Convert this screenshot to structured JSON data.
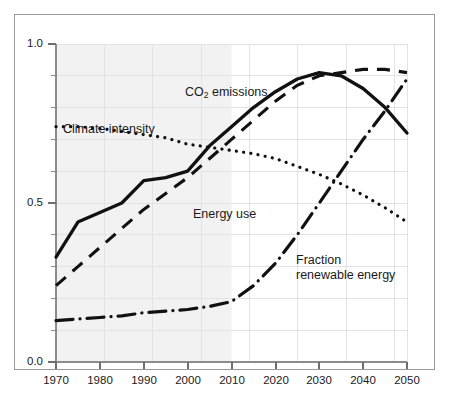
{
  "chart_data": {
    "type": "line",
    "title": "",
    "xlabel": "",
    "ylabel": "",
    "xlim": [
      1970,
      2050
    ],
    "ylim": [
      0.0,
      1.0
    ],
    "grid": true,
    "legend_position": "inline-annotations",
    "y_ticks_major": [
      "1.0",
      "0.5",
      "0.0"
    ],
    "y_ticks_major_values": [
      1.0,
      0.5,
      0.0
    ],
    "y_ticks_minor_values": [
      0.1,
      0.2,
      0.3,
      0.4,
      0.6,
      0.7,
      0.8,
      0.9
    ],
    "x_ticks": [
      "1970",
      "1980",
      "1990",
      "2000",
      "2010",
      "2020",
      "2030",
      "2040",
      "2050"
    ],
    "x_ticks_values": [
      1970,
      1980,
      1990,
      2000,
      2010,
      2020,
      2030,
      2040,
      2050
    ],
    "shaded_region": {
      "label": "historical period shading",
      "x_start": 1970,
      "x_end": 2010,
      "color": "#f2f2f2"
    },
    "x": [
      1970,
      1975,
      1980,
      1985,
      1990,
      1995,
      2000,
      2005,
      2010,
      2015,
      2020,
      2025,
      2030,
      2035,
      2040,
      2045,
      2050
    ],
    "series": [
      {
        "name": "CO2 emissions",
        "label": "CO₂ emissions",
        "style": "solid",
        "color": "#111111",
        "values": [
          0.33,
          0.44,
          0.47,
          0.5,
          0.57,
          0.58,
          0.6,
          0.68,
          0.74,
          0.8,
          0.85,
          0.89,
          0.91,
          0.9,
          0.86,
          0.8,
          0.72
        ]
      },
      {
        "name": "Energy use",
        "label": "Energy use",
        "style": "dashed",
        "color": "#111111",
        "values": [
          0.24,
          0.3,
          0.36,
          0.42,
          0.48,
          0.53,
          0.58,
          0.64,
          0.7,
          0.76,
          0.82,
          0.87,
          0.9,
          0.91,
          0.92,
          0.92,
          0.91
        ]
      },
      {
        "name": "Climate intensity",
        "label": "Climate intensity",
        "style": "dotted",
        "color": "#111111",
        "values": [
          0.74,
          0.74,
          0.735,
          0.725,
          0.715,
          0.705,
          0.685,
          0.675,
          0.665,
          0.655,
          0.64,
          0.615,
          0.59,
          0.56,
          0.525,
          0.485,
          0.44
        ]
      },
      {
        "name": "Fraction renewable energy",
        "label": "Fraction\nrenewable energy",
        "label_line1": "Fraction",
        "label_line2": "renewable energy",
        "style": "dash-dot",
        "color": "#111111",
        "values": [
          0.13,
          0.135,
          0.14,
          0.145,
          0.155,
          0.16,
          0.165,
          0.175,
          0.19,
          0.24,
          0.31,
          0.4,
          0.5,
          0.6,
          0.7,
          0.79,
          0.89
        ]
      }
    ],
    "annotations": [
      {
        "text": "CO₂ emissions",
        "x": 2005,
        "y": 0.875
      },
      {
        "text": "Climate intensity",
        "x": 1978,
        "y": 0.775
      },
      {
        "text": "Energy use",
        "x": 2000,
        "y": 0.53
      },
      {
        "text": "Fraction renewable energy",
        "x": 2030,
        "y": 0.335
      }
    ]
  },
  "labels": {
    "co2_emissions_pre": "CO",
    "co2_emissions_sub": "2",
    "co2_emissions_post": " emissions",
    "climate_intensity": "Climate intensity",
    "energy_use": "Energy use",
    "fraction_line1": "Fraction",
    "fraction_line2": "renewable energy"
  },
  "ticks": {
    "y": [
      "1.0",
      "0.5",
      "0.0"
    ],
    "x": [
      "1970",
      "1980",
      "1990",
      "2000",
      "2010",
      "2020",
      "2030",
      "2040",
      "2050"
    ]
  },
  "colors": {
    "line": "#111111",
    "axis": "#8c8c8c",
    "grid": "#e3e3e3",
    "shade": "#f2f2f2",
    "frame": "#9a9a9a",
    "text": "#1a1a1a",
    "background": "#ffffff"
  }
}
